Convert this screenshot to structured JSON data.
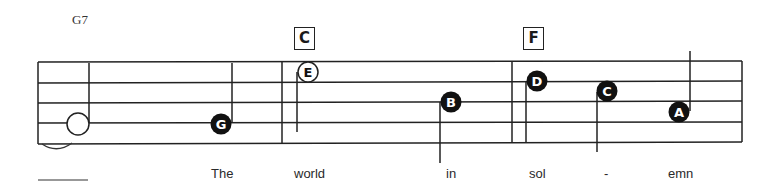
{
  "chords": [
    {
      "label": "G7",
      "style": "plain"
    },
    {
      "label": "C",
      "style": "boxed"
    },
    {
      "label": "F",
      "style": "boxed"
    }
  ],
  "notes": [
    {
      "letter": "",
      "style": "open-whole-ish"
    },
    {
      "letter": "G",
      "style": "filled"
    },
    {
      "letter": "E",
      "style": "open"
    },
    {
      "letter": "B",
      "style": "filled"
    },
    {
      "letter": "D",
      "style": "filled"
    },
    {
      "letter": "C",
      "style": "filled"
    },
    {
      "letter": "A",
      "style": "filled"
    }
  ],
  "lyrics": [
    "The",
    "world",
    "in",
    "sol",
    "-",
    "emn"
  ]
}
